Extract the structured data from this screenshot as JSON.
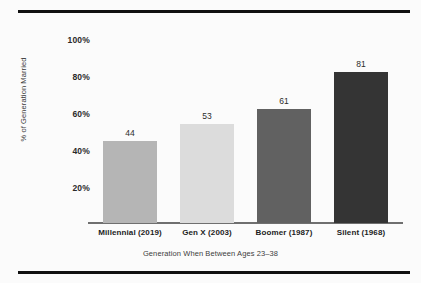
{
  "chart_data": {
    "type": "bar",
    "title": "",
    "xlabel": "Generation When Between Ages 23–38",
    "ylabel": "% of Generation Married",
    "categories": [
      "Millennial (2019)",
      "Gen X (2003)",
      "Boomer (1987)",
      "Silent (1968)"
    ],
    "values": [
      44,
      53,
      61,
      81
    ],
    "value_labels": [
      "44",
      "53",
      "61",
      "81"
    ],
    "bar_colors": [
      "#b5b5b5",
      "#dcdcdc",
      "#616161",
      "#343434"
    ],
    "ylim": [
      0,
      100
    ],
    "yticks": [
      100,
      80,
      60,
      40,
      20
    ],
    "ytick_labels": [
      "100%",
      "80%",
      "60%",
      "40%",
      "20%"
    ],
    "grid": false,
    "legend": null
  },
  "figure": {
    "background_color": "#fbfbfb",
    "rule_color": "#111111",
    "axis_color": "#6f6f6f"
  }
}
